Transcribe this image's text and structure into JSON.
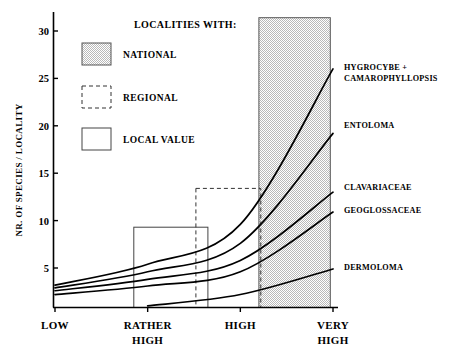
{
  "chart_data": {
    "type": "line",
    "title": "",
    "subtitle": "",
    "xlabel": "",
    "ylabel": "NR. OF SPECIES / LOCALITY",
    "categories": [
      "LOW",
      "RATHER HIGH",
      "HIGH",
      "VERY HIGH"
    ],
    "category_lines": [
      [
        "LOW"
      ],
      [
        "RATHER",
        "HIGH"
      ],
      [
        "HIGH"
      ],
      [
        "VERY",
        "HIGH"
      ]
    ],
    "ylim": [
      0,
      31.5
    ],
    "yticks": [
      5,
      10,
      15,
      20,
      25,
      30
    ],
    "ytick_labels": [
      "5",
      "10",
      "15",
      "20",
      "25",
      "30"
    ],
    "grid": false,
    "legend_position": "top-left-inside",
    "x_values": [
      1,
      2,
      3,
      4
    ],
    "series": [
      {
        "name": "HYGROCYBE + CAMAROPHYLLOPSIS",
        "label_lines": [
          "HYGROCYBE +",
          "CAMAROPHYLLOPSIS"
        ],
        "values": [
          3.2,
          5.4,
          9.6,
          26.0
        ]
      },
      {
        "name": "ENTOLOMA",
        "label_lines": [
          "ENTOLOMA"
        ],
        "values": [
          2.9,
          4.6,
          7.6,
          19.2
        ]
      },
      {
        "name": "CLAVARIACEAE",
        "label_lines": [
          "CLAVARIACEAE"
        ],
        "values": [
          2.6,
          3.8,
          5.8,
          13.0
        ]
      },
      {
        "name": "GEOGLOSSACEAE",
        "label_lines": [
          "GEOGLOSSACEAE"
        ],
        "values": [
          2.2,
          3.1,
          4.6,
          10.9
        ]
      },
      {
        "name": "DERMOLOMA",
        "label_lines": [
          "DERMOLOMA"
        ],
        "values": [
          null,
          1.0,
          2.2,
          4.9
        ]
      }
    ],
    "boxes": [
      {
        "kind": "local",
        "x_start": 1.85,
        "x_end": 2.65,
        "top": 9.3,
        "style": "solid"
      },
      {
        "kind": "regional",
        "x_start": 2.52,
        "x_end": 3.22,
        "top": 13.4,
        "style": "dashed"
      },
      {
        "kind": "national",
        "x_start": 3.2,
        "x_end": 3.97,
        "top": 31.4,
        "style": "shaded"
      }
    ],
    "annotations": []
  },
  "legend": {
    "title": "LOCALITIES WITH:",
    "items": [
      {
        "label": "NATIONAL",
        "swatch": "shaded"
      },
      {
        "label": "REGIONAL",
        "swatch": "dashed"
      },
      {
        "label": "LOCAL  VALUE",
        "swatch": "solid"
      }
    ]
  },
  "colors": {
    "axis": "#000000",
    "curve": "#000000",
    "shaded_fill": "#c8c8c8",
    "box_outline": "#333333",
    "background": "#ffffff"
  }
}
